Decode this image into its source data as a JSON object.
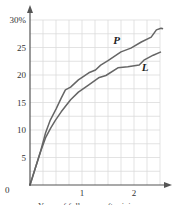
{
  "chart_data": {
    "type": "line",
    "title": "",
    "xlabel": "Years of follow-up after injury",
    "ylabel": "",
    "xlim": [
      0,
      2.5
    ],
    "ylim": [
      0,
      30
    ],
    "x_ticks": [
      "1",
      "2"
    ],
    "x_tick_values": [
      1,
      2
    ],
    "origin_label": "0",
    "y_ticks": [
      "5",
      "10",
      "15",
      "20",
      "25",
      "30%"
    ],
    "y_tick_values": [
      5,
      10,
      15,
      20,
      25,
      30
    ],
    "grid": true,
    "grid_x_step": 0.25,
    "grid_y_step": 2.5,
    "legend": "inline labels",
    "series": [
      {
        "name": "P",
        "color": "#666666",
        "points": [
          [
            0,
            0
          ],
          [
            0.1,
            3.0
          ],
          [
            0.2,
            6.0
          ],
          [
            0.3,
            9.5
          ],
          [
            0.39,
            11.8
          ],
          [
            0.5,
            13.8
          ],
          [
            0.6,
            15.8
          ],
          [
            0.68,
            17.3
          ],
          [
            0.78,
            17.8
          ],
          [
            0.93,
            19.1
          ],
          [
            1.13,
            20.4
          ],
          [
            1.26,
            20.9
          ],
          [
            1.36,
            21.8
          ],
          [
            1.5,
            22.6
          ],
          [
            1.75,
            24.2
          ],
          [
            1.94,
            24.9
          ],
          [
            2.14,
            26.0
          ],
          [
            2.33,
            26.9
          ],
          [
            2.43,
            28.2
          ],
          [
            2.52,
            28.5
          ],
          [
            2.56,
            28.4
          ]
        ],
        "label_pos": [
          1.6,
          25.7
        ]
      },
      {
        "name": "L",
        "color": "#666666",
        "points": [
          [
            0,
            0
          ],
          [
            0.1,
            3.0
          ],
          [
            0.2,
            6.0
          ],
          [
            0.3,
            8.6
          ],
          [
            0.4,
            10.4
          ],
          [
            0.49,
            11.8
          ],
          [
            0.6,
            13.3
          ],
          [
            0.78,
            15.5
          ],
          [
            0.93,
            16.9
          ],
          [
            1.13,
            18.2
          ],
          [
            1.32,
            19.5
          ],
          [
            1.46,
            19.9
          ],
          [
            1.69,
            21.3
          ],
          [
            1.88,
            21.5
          ],
          [
            2.1,
            21.8
          ],
          [
            2.19,
            22.7
          ],
          [
            2.37,
            23.6
          ],
          [
            2.52,
            24.2
          ]
        ],
        "label_pos": [
          2.15,
          20.8
        ]
      }
    ]
  }
}
